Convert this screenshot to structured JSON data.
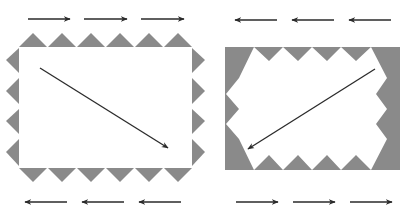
{
  "colors": {
    "background": "#ffffff",
    "tooth_fill": "#8a8a8a",
    "arrow": "#2a2a2a",
    "panel_white": "#ffffff"
  },
  "left_figure": {
    "description": "White rectangle with outward-pointing triangular teeth on all edges",
    "rect": {
      "x": 19,
      "y": 47,
      "w": 173,
      "h": 121
    },
    "teeth": {
      "top": 6,
      "bottom": 6,
      "left": 4,
      "right": 4,
      "direction": "outward"
    },
    "top_arrows": {
      "count": 3,
      "direction": "right"
    },
    "bottom_arrows": {
      "count": 3,
      "direction": "left"
    },
    "diagonal_arrow": {
      "from": [
        40,
        68
      ],
      "to": [
        168,
        148
      ]
    }
  },
  "right_figure": {
    "description": "Gray rectangle with inward-pointing triangular teeth bounding a white interior",
    "rect": {
      "x": 225,
      "y": 47,
      "w": 175,
      "h": 123
    },
    "teeth": {
      "top": 6,
      "bottom": 6,
      "left": 4,
      "right": 4,
      "direction": "inward"
    },
    "top_arrows": {
      "count": 3,
      "direction": "left"
    },
    "bottom_arrows": {
      "count": 3,
      "direction": "right"
    },
    "diagonal_arrow": {
      "from": [
        375,
        69
      ],
      "to": [
        248,
        149
      ]
    }
  }
}
